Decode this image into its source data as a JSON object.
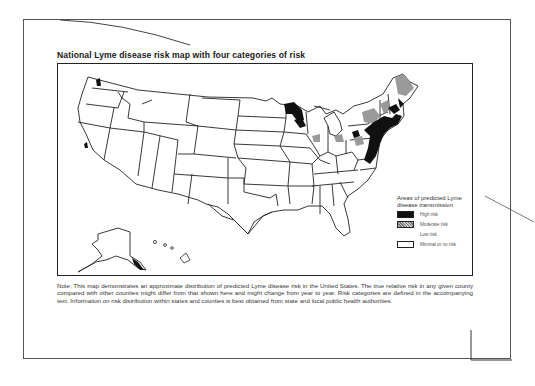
{
  "document": {
    "title": "National Lyme disease risk map with four categories of risk",
    "note": "Note: This map demonstrates an approximate distribution of predicted Lyme disease risk in the United States. The true relative risk in any given county compared with other counties might differ from that shown here and might change from year to year. Risk categories are defined in the accompanying text. Information on risk distribution within states and counties is best obtained from state and local public health authorities."
  },
  "map": {
    "region": "United States (including Alaska and Hawaii insets)",
    "legend": {
      "title": "Areas of predicted Lyme disease transmission",
      "items": [
        {
          "label": "High risk",
          "swatch": "#111111"
        },
        {
          "label": "Moderate risk",
          "swatch": "#999999"
        },
        {
          "label": "Low risk",
          "swatch": "#ffffff"
        },
        {
          "label": "Minimal or no risk",
          "swatch": "#ffffff"
        }
      ]
    },
    "colors": {
      "high": "#111111",
      "moderate": "#9a9a9a",
      "outline": "#222222"
    }
  }
}
